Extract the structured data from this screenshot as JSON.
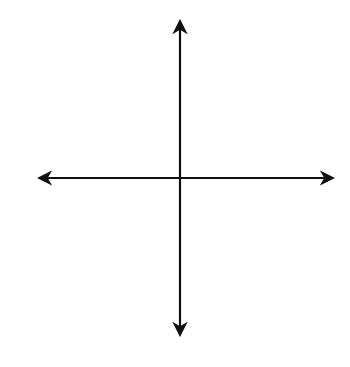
{
  "chart_data": {
    "type": "line",
    "title": "",
    "function": "y = 4 - x^2/2",
    "xlabel": "x",
    "ylabel": "y",
    "tick_labels": {
      "x": "1",
      "y": "1"
    },
    "xlim": [
      -5,
      5
    ],
    "ylim": [
      -5,
      5
    ],
    "grid": true,
    "grid_step": 1,
    "vertex": [
      0,
      4
    ],
    "x_intercepts": [
      -2.83,
      2.83
    ],
    "y_intercept": 4,
    "opens": "down",
    "series": [
      {
        "name": "parabola",
        "x": [
          -4.35,
          -4,
          -3,
          -2.83,
          -2,
          -1,
          0,
          1,
          2,
          2.83,
          3,
          4,
          4.35
        ],
        "values": [
          -5.46,
          -4,
          -0.5,
          0,
          2,
          3.5,
          4,
          3.5,
          2,
          0,
          -0.5,
          -4,
          -5.46
        ]
      }
    ],
    "legend": null
  },
  "colors": {
    "grid": "#b8b8b8",
    "axis": "#111111",
    "curve": "#7a7a7a"
  },
  "labels": {
    "x_axis": "x",
    "y_axis": "y",
    "x_tick": "1",
    "y_tick": "1"
  }
}
